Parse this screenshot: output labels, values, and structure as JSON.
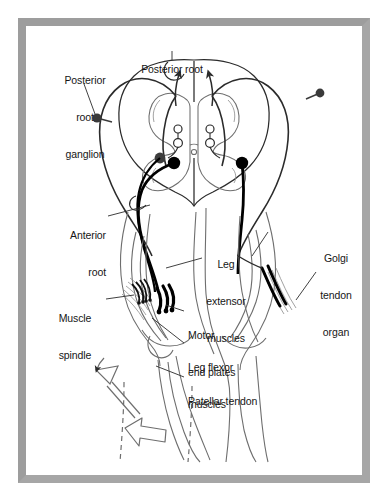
{
  "figure": {
    "frame_color": "#9d9d9d",
    "background_color": "#ffffff",
    "ink_color": "#2b2b2b",
    "bold_neuron_color": "#000000",
    "light_outline_color": "#6e6e6e"
  },
  "labels": {
    "posterior_root_ganglion": {
      "lines": [
        "Posterior",
        "root",
        "ganglion"
      ],
      "text": "Posterior root ganglion",
      "align": "center"
    },
    "posterior_root": {
      "lines": [
        "Posterior root"
      ],
      "text": "Posterior root",
      "align": "center"
    },
    "anterior_root": {
      "lines": [
        "Anterior",
        "root"
      ],
      "text": "Anterior root",
      "align": "right"
    },
    "muscle_spindle": {
      "lines": [
        "Muscle",
        "spindle"
      ],
      "text": "Muscle spindle",
      "align": "center"
    },
    "leg_extensor_muscles": {
      "lines": [
        "Leg",
        "extensor",
        "muscles"
      ],
      "text": "Leg extensor muscles",
      "align": "center"
    },
    "golgi_tendon_organ": {
      "lines": [
        "Golgi",
        "tendon",
        "organ"
      ],
      "text": "Golgi tendon organ",
      "align": "center"
    },
    "motor_end_plates": {
      "lines": [
        "Motor",
        "end plates"
      ],
      "text": "Motor end plates",
      "align": "left"
    },
    "leg_flexor_muscles": {
      "lines": [
        "Leg flexor",
        "muscles"
      ],
      "text": "Leg flexor muscles",
      "align": "left"
    },
    "patellar_tendon": {
      "lines": [
        "Patellar tendon"
      ],
      "text": "Patellar tendon",
      "align": "left"
    }
  }
}
